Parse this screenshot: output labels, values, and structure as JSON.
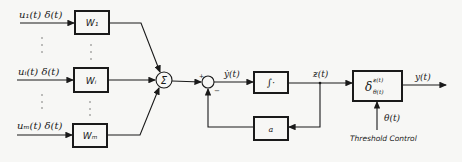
{
  "inputs": [
    {
      "label": "u₁(t) δ(t)",
      "weight": "W₁"
    },
    {
      "label": "uᵢ(t) δ(t)",
      "weight": "Wᵢ"
    },
    {
      "label": "uₘ(t) δ(t)",
      "weight": "Wₘ"
    }
  ],
  "summer": {
    "symbol": "Σ"
  },
  "junction": {
    "plus": "+",
    "minus": "−"
  },
  "derivative_signal": "ẏ(t)",
  "integrator": {
    "symbol": "∫·"
  },
  "feedback": {
    "symbol": "a"
  },
  "state_signal": "ƶ(t)",
  "threshold_block": {
    "main": "δ",
    "sup": "ƶ(t)",
    "sub": "θ(t)"
  },
  "output_signal": "y(t)",
  "threshold_signal": "θ(t)",
  "threshold_caption": "Threshold Control"
}
